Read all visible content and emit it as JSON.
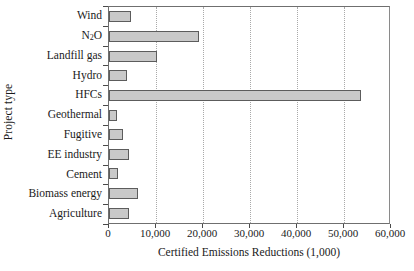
{
  "chart_data": {
    "type": "bar",
    "orientation": "horizontal",
    "title": "",
    "xlabel": "Certified Emissions Reductions (1,000)",
    "ylabel": "Project type",
    "categories": [
      "Wind",
      "N2O",
      "Landfill gas",
      "Hydro",
      "HFCs",
      "Geothermal",
      "Fugitive",
      "EE industry",
      "Cement",
      "Biomass energy",
      "Agriculture"
    ],
    "values": [
      4700,
      19100,
      10200,
      3900,
      53700,
      1600,
      2900,
      4200,
      2000,
      6200,
      4200
    ],
    "xlim": [
      0,
      60000
    ],
    "xticks": [
      0,
      10000,
      20000,
      30000,
      40000,
      50000,
      60000
    ],
    "xtick_labels": [
      "0",
      "10,000",
      "20,000",
      "30,000",
      "40,000",
      "50,000",
      "60,000"
    ],
    "grid": true,
    "grid_axis": "x",
    "grid_style": "dotted",
    "legend": false,
    "bar_fill_color": "#c9c9c9",
    "bar_edge_color": "#5c5c5c",
    "axis_color": "#6f6f6f",
    "gridline_color": "#a9a9a9",
    "background_color": "#ffffff"
  },
  "axes": {
    "y_title": "Project type",
    "x_title": "Certified Emissions Reductions (1,000)"
  },
  "category_labels": [
    {
      "text": "Wind",
      "sub": ""
    },
    {
      "text": "N",
      "sub": "2",
      "tail": "O"
    },
    {
      "text": "Landfill gas",
      "sub": ""
    },
    {
      "text": "Hydro",
      "sub": ""
    },
    {
      "text": "HFCs",
      "sub": ""
    },
    {
      "text": "Geothermal",
      "sub": ""
    },
    {
      "text": "Fugitive",
      "sub": ""
    },
    {
      "text": "EE industry",
      "sub": ""
    },
    {
      "text": "Cement",
      "sub": ""
    },
    {
      "text": "Biomass energy",
      "sub": ""
    },
    {
      "text": "Agriculture",
      "sub": ""
    }
  ]
}
